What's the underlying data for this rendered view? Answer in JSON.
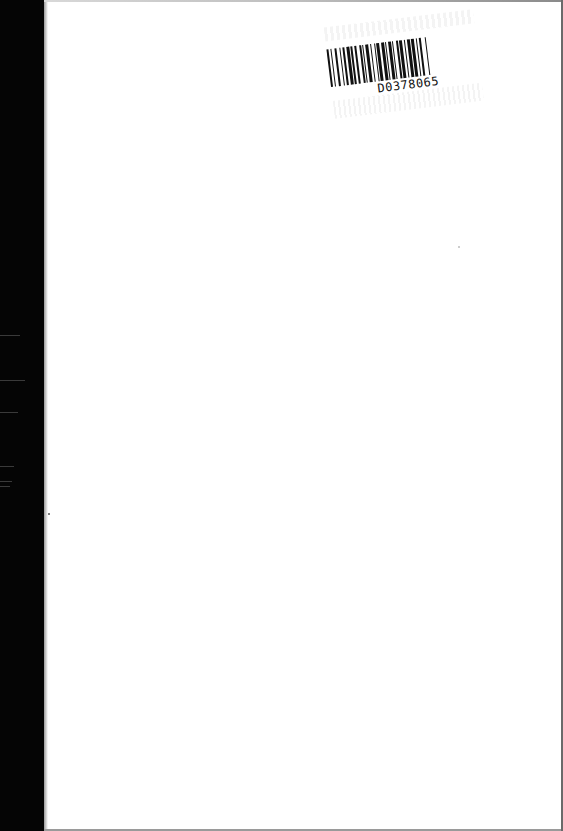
{
  "page": {
    "type": "scanned-blank-page",
    "background_color": "#ffffff",
    "scan_edge_color": "#050505"
  },
  "barcode": {
    "code": "D0378065",
    "bar_color": "#111111",
    "rotation_deg": -7
  }
}
